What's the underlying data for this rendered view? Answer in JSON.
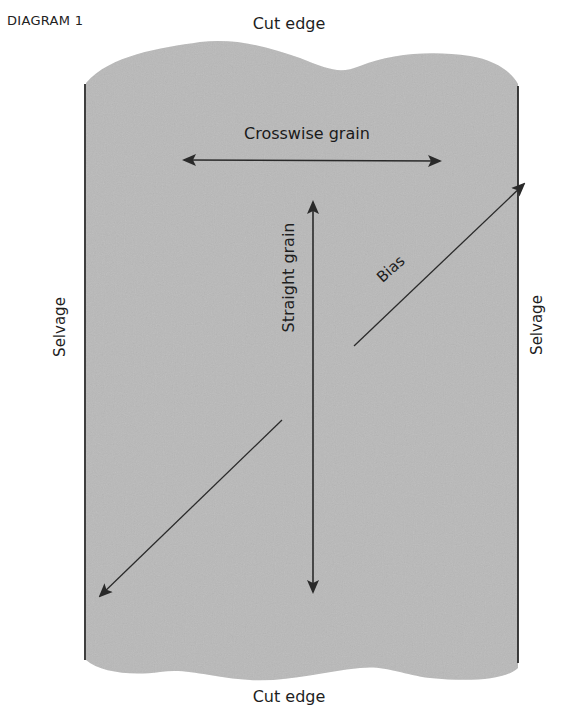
{
  "title": "DIAGRAM 1",
  "labels": {
    "cut_edge_top": "Cut edge",
    "cut_edge_bottom": "Cut edge",
    "selvage_left": "Selvage",
    "selvage_right": "Selvage",
    "crosswise_grain": "Crosswise grain",
    "straight_grain": "Straight grain",
    "bias": "Bias"
  },
  "colors": {
    "fabric": "#b9b9b9",
    "line": "#2a2a2a",
    "background": "#ffffff"
  }
}
